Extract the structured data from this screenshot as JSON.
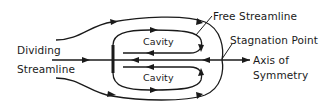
{
  "diagram": {
    "type": "flow-schematic",
    "labels": {
      "free_streamline": "Free Streamline",
      "stagnation_point": "Stagnation Point",
      "dividing_line1": "Dividing",
      "dividing_line2": "Streamline",
      "axis_line1": "Axis of",
      "axis_line2": "Symmetry",
      "cavity_top": "Cavity",
      "cavity_bottom": "Cavity"
    },
    "elements": [
      {
        "name": "plate",
        "description": "thick vertical bluff body on axis"
      },
      {
        "name": "outer-streamlines",
        "count": 2,
        "direction": "left-to-right, closing at stagnation point"
      },
      {
        "name": "cavity-loops",
        "count": 2,
        "direction": "recirculating, returning toward plate"
      },
      {
        "name": "axis-of-symmetry",
        "direction": "horizontal"
      }
    ],
    "colors": {
      "ink": "#1a1a1a",
      "background": "#ffffff"
    }
  }
}
